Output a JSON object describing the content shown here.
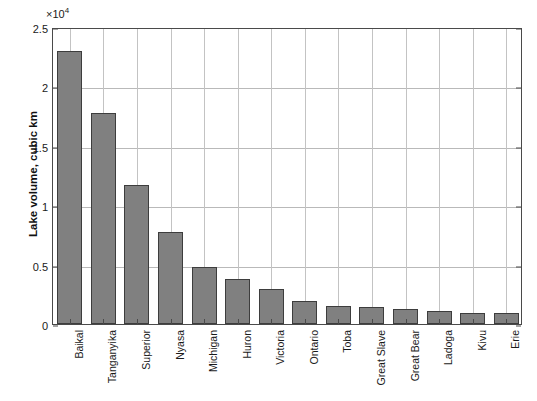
{
  "chart_data": {
    "type": "bar",
    "title": "",
    "subtitle": "",
    "xlabel": "",
    "ylabel": "Lake volume, cubic km",
    "exponent_label": "×10",
    "exponent_power": "4",
    "axis_multiplier": 10000,
    "ylim": [
      0,
      25000
    ],
    "ytick_labels": [
      "0",
      "0.5",
      "1",
      "1.5",
      "2",
      "2.5"
    ],
    "ytick_values": [
      0,
      5000,
      10000,
      15000,
      20000,
      25000
    ],
    "grid": true,
    "legend": null,
    "bar_color": "#808080",
    "bar_edge_color": "#3d3d3d",
    "categories": [
      "Baikal",
      "Tanganyika",
      "Superior",
      "Nyasa",
      "Michigan",
      "Huron",
      "Victoria",
      "Ontario",
      "Toba",
      "Great Slave",
      "Great Bear",
      "Ladoga",
      "Kivu",
      "Erie"
    ],
    "values": [
      23000,
      17800,
      11700,
      7775,
      4800,
      3750,
      2950,
      1900,
      1500,
      1400,
      1300,
      1100,
      900,
      900
    ]
  }
}
